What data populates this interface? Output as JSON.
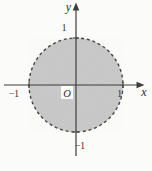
{
  "figure": {
    "type": "math-diagram",
    "region": {
      "shape": "disk",
      "center": [
        0,
        0
      ],
      "radius": 1,
      "boundary_style": "dashed",
      "interior_shaded": true
    },
    "axes": {
      "x_label": "x",
      "y_label": "y",
      "origin_label": "O",
      "x_ticks": [
        -1,
        1
      ],
      "y_ticks": [
        -1,
        1
      ],
      "arrows": [
        "positive-x",
        "positive-y"
      ]
    },
    "colors": {
      "background": "#fbfbf9",
      "disk_fill": "#c8c8c8",
      "boundary_stroke": "#454545",
      "axis_stroke": "#3d3d3d",
      "text": "#2e2e2e",
      "origin_box": "#fbfbf9"
    }
  },
  "labels": {
    "y_axis": "y",
    "x_axis": "x",
    "origin": "O",
    "tick_y_pos": "1",
    "tick_y_neg": "−1",
    "tick_x_pos": "1",
    "tick_x_neg": "−1"
  }
}
